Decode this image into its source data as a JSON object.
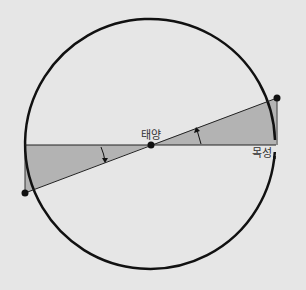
{
  "diagram": {
    "labels": {
      "sun": "태양",
      "jupiter": "목성"
    },
    "colors": {
      "background": "#e6e6e6",
      "circle": "#111111",
      "shaded_triangle": "#b3b3b3",
      "line": "#222222",
      "point": "#111111"
    },
    "geometry": {
      "circle": {
        "cx": 150,
        "cy": 145,
        "r": 125
      },
      "horizontal_line": {
        "x1": 25,
        "y1": 145,
        "x2": 276,
        "y2": 145
      },
      "tilted_line": {
        "x1": 25,
        "y1": 193,
        "x2": 277,
        "y2": 98
      },
      "points": [
        {
          "name": "sun",
          "x": 151,
          "y": 145
        },
        {
          "name": "upper-right-point",
          "x": 277,
          "y": 98
        },
        {
          "name": "lower-left-point",
          "x": 25,
          "y": 193
        }
      ],
      "shaded_triangles": [
        {
          "name": "right-triangle",
          "points": "151,145 276,145 277,98"
        },
        {
          "name": "left-triangle",
          "points": "151,145 25,145 25,193"
        }
      ],
      "angle_arrows": [
        {
          "name": "left-angle-arrow",
          "direction": "down",
          "x": 104,
          "y1": 146,
          "y2": 162
        },
        {
          "name": "right-angle-arrow",
          "direction": "up",
          "x": 200,
          "y1": 144,
          "y2": 129
        }
      ]
    }
  }
}
